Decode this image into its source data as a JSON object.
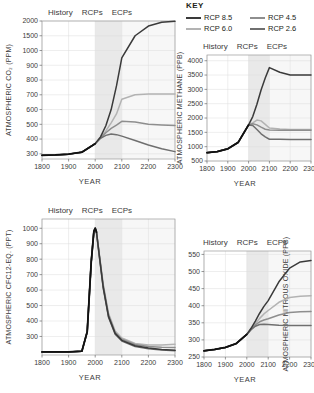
{
  "key": {
    "title": "KEY",
    "items": [
      {
        "label": "RCP 8.5",
        "color": "#3a3a3a"
      },
      {
        "label": "RCP 4.5",
        "color": "#8e8e8e"
      },
      {
        "label": "RCP 6.0",
        "color": "#b3b3b3"
      },
      {
        "label": "RCP 2.6",
        "color": "#6f6f6f"
      }
    ]
  },
  "period_labels": {
    "history": "History",
    "rcps": "RCPs",
    "ecps": "ECPs"
  },
  "x_title": "YEAR",
  "chart_data": [
    {
      "type": "line",
      "id": "co2",
      "title": "",
      "ylabel": "ATMOSPHERIC CO₂ (PPM)",
      "xlabel": "YEAR",
      "xlim": [
        1800,
        2300
      ],
      "xticks": [
        1800,
        1900,
        2000,
        2100,
        2200,
        2300
      ],
      "yticks": [
        300,
        400,
        500,
        600,
        700,
        800,
        900,
        1000,
        1500,
        2000
      ],
      "ylim": [
        230,
        2000
      ],
      "yscale": "piecewise-linear",
      "grid": true,
      "shaded_bands": [
        {
          "from": 2000,
          "to": 2100,
          "label": "RCPs"
        }
      ],
      "x": [
        1800,
        1850,
        1900,
        1950,
        2000,
        2020,
        2040,
        2060,
        2080,
        2100,
        2150,
        2200,
        2250,
        2300
      ],
      "series": [
        {
          "name": "RCP 8.5",
          "color": "#3a3a3a",
          "values": [
            280,
            285,
            296,
            311,
            369,
            415,
            490,
            600,
            760,
            950,
            1500,
            1830,
            1960,
            1990
          ]
        },
        {
          "name": "RCP 6.0",
          "color": "#b3b3b3",
          "values": [
            280,
            285,
            296,
            311,
            369,
            410,
            455,
            510,
            570,
            670,
            700,
            705,
            705,
            705
          ]
        },
        {
          "name": "RCP 4.5",
          "color": "#8e8e8e",
          "values": [
            280,
            285,
            296,
            311,
            369,
            408,
            443,
            473,
            495,
            520,
            515,
            500,
            495,
            492
          ]
        },
        {
          "name": "RCP 2.6",
          "color": "#6f6f6f",
          "values": [
            280,
            285,
            296,
            311,
            369,
            405,
            425,
            435,
            430,
            420,
            390,
            360,
            335,
            315
          ]
        }
      ]
    },
    {
      "type": "line",
      "id": "ch4",
      "title": "",
      "ylabel": "ATMOSPHERIC METHANE (PPB)",
      "xlabel": "YEAR",
      "xlim": [
        1800,
        2300
      ],
      "xticks": [
        1800,
        1900,
        2000,
        2100,
        2200,
        2300
      ],
      "yticks": [
        500,
        1000,
        1500,
        2000,
        2500,
        3000,
        3500,
        4000
      ],
      "ylim": [
        500,
        4200
      ],
      "yscale": "linear",
      "grid": true,
      "shaded_bands": [
        {
          "from": 2000,
          "to": 2100,
          "label": "RCPs"
        }
      ],
      "x": [
        1800,
        1850,
        1900,
        1950,
        2000,
        2020,
        2040,
        2060,
        2080,
        2100,
        2150,
        2200,
        2250,
        2300
      ],
      "series": [
        {
          "name": "RCP 8.5",
          "color": "#3a3a3a",
          "values": [
            790,
            830,
            925,
            1150,
            1760,
            2050,
            2480,
            2980,
            3400,
            3760,
            3600,
            3500,
            3500,
            3500
          ]
        },
        {
          "name": "RCP 6.0",
          "color": "#b3b3b3",
          "values": [
            790,
            830,
            925,
            1150,
            1760,
            1830,
            1930,
            1900,
            1780,
            1650,
            1620,
            1600,
            1600,
            1600
          ]
        },
        {
          "name": "RCP 4.5",
          "color": "#8e8e8e",
          "values": [
            790,
            830,
            925,
            1150,
            1760,
            1800,
            1760,
            1680,
            1610,
            1580,
            1575,
            1570,
            1570,
            1570
          ]
        },
        {
          "name": "RCP 2.6",
          "color": "#6f6f6f",
          "values": [
            790,
            830,
            925,
            1150,
            1760,
            1740,
            1600,
            1450,
            1340,
            1260,
            1255,
            1250,
            1250,
            1250
          ]
        }
      ]
    },
    {
      "type": "line",
      "id": "cfc12eq",
      "title": "",
      "ylabel": "ATMOSPHERIC CFC12-EQ. (PPT)",
      "xlabel": "YEAR",
      "xlim": [
        1800,
        2300
      ],
      "xticks": [
        1800,
        1900,
        2000,
        2100,
        2200,
        2300
      ],
      "yticks": [
        300,
        400,
        500,
        600,
        700,
        800,
        900,
        1000
      ],
      "ylim": [
        180,
        1060
      ],
      "yscale": "linear",
      "grid": true,
      "shaded_bands": [
        {
          "from": 2000,
          "to": 2100,
          "label": "RCPs"
        }
      ],
      "x": [
        1800,
        1900,
        1950,
        1970,
        1985,
        1995,
        2000,
        2005,
        2015,
        2030,
        2050,
        2075,
        2100,
        2150,
        2200,
        2250,
        2300
      ],
      "series": [
        {
          "name": "RCP 8.5",
          "color": "#3a3a3a",
          "values": [
            200,
            200,
            205,
            330,
            780,
            980,
            1000,
            975,
            830,
            620,
            430,
            320,
            275,
            240,
            225,
            215,
            210
          ]
        },
        {
          "name": "RCP 6.0",
          "color": "#b3b3b3",
          "values": [
            200,
            200,
            205,
            330,
            780,
            980,
            1000,
            970,
            840,
            640,
            450,
            335,
            290,
            255,
            245,
            245,
            250
          ]
        },
        {
          "name": "RCP 4.5",
          "color": "#8e8e8e",
          "values": [
            200,
            200,
            205,
            330,
            780,
            980,
            1000,
            972,
            835,
            630,
            440,
            325,
            282,
            248,
            235,
            230,
            228
          ]
        },
        {
          "name": "RCP 2.6",
          "color": "#6f6f6f",
          "values": [
            200,
            200,
            205,
            330,
            780,
            980,
            1000,
            968,
            825,
            615,
            425,
            315,
            270,
            235,
            220,
            212,
            208
          ]
        }
      ]
    },
    {
      "type": "line",
      "id": "n2o",
      "title": "",
      "ylabel": "ATMOSPHERIC NITROUS OXIDE (PPB)",
      "xlabel": "YEAR",
      "xlim": [
        1800,
        2300
      ],
      "xticks": [
        1800,
        1900,
        2000,
        2100,
        2200,
        2300
      ],
      "yticks": [
        250,
        300,
        350,
        400,
        450,
        500,
        550
      ],
      "ylim": [
        250,
        560
      ],
      "yscale": "linear",
      "grid": true,
      "shaded_bands": [
        {
          "from": 2000,
          "to": 2100,
          "label": "RCPs"
        }
      ],
      "x": [
        1800,
        1850,
        1900,
        1950,
        2000,
        2020,
        2040,
        2060,
        2080,
        2100,
        2150,
        2200,
        2250,
        2300
      ],
      "series": [
        {
          "name": "RCP 8.5",
          "color": "#3a3a3a",
          "values": [
            268,
            272,
            278,
            289,
            316,
            334,
            355,
            378,
            398,
            415,
            470,
            510,
            528,
            532
          ]
        },
        {
          "name": "RCP 6.0",
          "color": "#b3b3b3",
          "values": [
            268,
            272,
            278,
            289,
            316,
            332,
            348,
            363,
            376,
            386,
            410,
            424,
            428,
            429
          ]
        },
        {
          "name": "RCP 4.5",
          "color": "#8e8e8e",
          "values": [
            268,
            272,
            278,
            289,
            316,
            331,
            344,
            353,
            358,
            362,
            373,
            380,
            382,
            383
          ]
        },
        {
          "name": "RCP 2.6",
          "color": "#6f6f6f",
          "values": [
            268,
            272,
            278,
            289,
            316,
            330,
            340,
            345,
            346,
            345,
            343,
            342,
            342,
            342
          ]
        }
      ]
    }
  ]
}
